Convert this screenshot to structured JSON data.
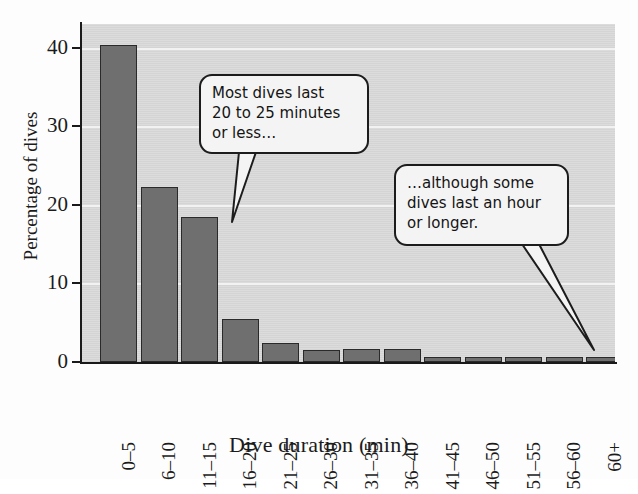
{
  "figure": {
    "background_color": "#fdfdfd",
    "plot_background_color": "#d7d7d7",
    "bar_color": "#6f6f6f",
    "bar_border_color": "#2a2a2a",
    "gridline_color": "#f2f2f2",
    "axis_color": "#1a1a1a"
  },
  "chart_data": {
    "type": "bar",
    "title": "",
    "subtitle": "",
    "xlabel": "Dive duration (min)",
    "ylabel": "Percentage of dives",
    "categories": [
      "0–5",
      "6–10",
      "11–15",
      "16–20",
      "21–25",
      "26–30",
      "31–35",
      "36–40",
      "41–45",
      "46–50",
      "51–55",
      "56–60",
      "60+"
    ],
    "values": [
      40.3,
      22.3,
      18.4,
      5.5,
      2.4,
      1.5,
      1.6,
      1.6,
      0.6,
      0.6,
      0.6,
      0.6,
      0.6
    ],
    "ylim": [
      0,
      43
    ],
    "yticks": [
      0,
      10,
      20,
      30,
      40
    ],
    "ytick_labels": [
      "0",
      "10",
      "20",
      "30",
      "40"
    ],
    "grid": true,
    "grid_axis": "y",
    "legend": false,
    "legend_position": "none",
    "xtick_rotation": 90,
    "annotations": [
      {
        "id": "callout-1",
        "lines": [
          "Most dives last",
          "20 to 25 minutes",
          "or less…"
        ],
        "points_to_category": "16–20"
      },
      {
        "id": "callout-2",
        "lines": [
          "…although some",
          "dives last an hour",
          "or longer."
        ],
        "points_to_category": "60+"
      }
    ]
  }
}
